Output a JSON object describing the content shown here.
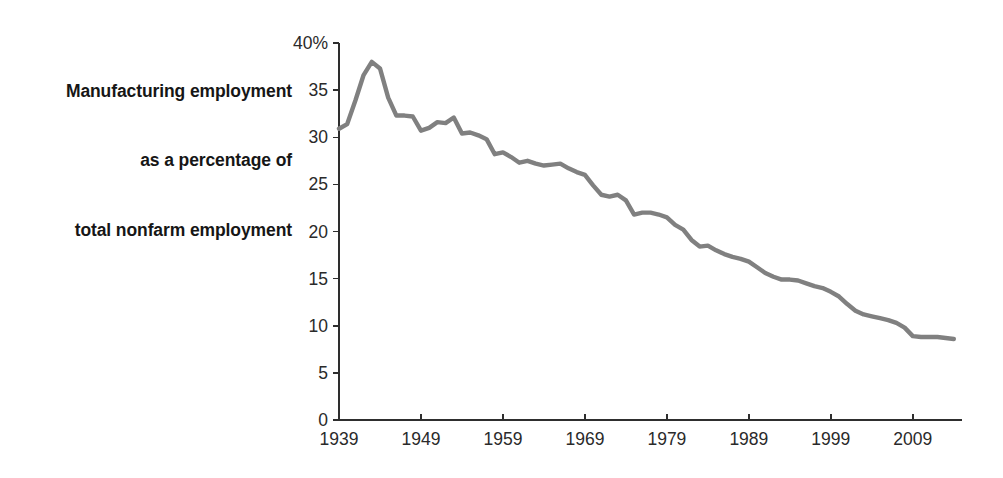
{
  "figure": {
    "background_color": "#ffffff",
    "axis_color": "#2e2e2e",
    "line_color": "#808080",
    "label_lines": [
      "Manufacturing employment",
      "as a percentage of",
      "total nonfarm employment"
    ]
  },
  "chart_data": {
    "type": "line",
    "title": "",
    "subtitle": "",
    "xlabel": "",
    "ylabel": "Manufacturing employment as a percentage of total nonfarm employment",
    "xlim": [
      1939,
      2015
    ],
    "ylim": [
      0,
      40
    ],
    "grid": false,
    "legend": null,
    "y_tick_labels": [
      "40%",
      "35",
      "30",
      "25",
      "20",
      "15",
      "10",
      "5",
      "0"
    ],
    "y_ticks": [
      40,
      35,
      30,
      25,
      20,
      15,
      10,
      5,
      0
    ],
    "x_tick_labels": [
      "1939",
      "1949",
      "1959",
      "1969",
      "1979",
      "1989",
      "1999",
      "2009"
    ],
    "x_ticks": [
      1939,
      1949,
      1959,
      1969,
      1979,
      1989,
      1999,
      2009
    ],
    "series": [
      {
        "name": "Manufacturing share of total nonfarm employment",
        "color": "#808080",
        "x": [
          1939,
          1940,
          1941,
          1942,
          1943,
          1944,
          1945,
          1946,
          1947,
          1948,
          1949,
          1950,
          1951,
          1952,
          1953,
          1954,
          1955,
          1956,
          1957,
          1958,
          1959,
          1960,
          1961,
          1962,
          1963,
          1964,
          1965,
          1966,
          1967,
          1968,
          1969,
          1970,
          1971,
          1972,
          1973,
          1974,
          1975,
          1976,
          1977,
          1978,
          1979,
          1980,
          1981,
          1982,
          1983,
          1984,
          1985,
          1986,
          1987,
          1988,
          1989,
          1990,
          1991,
          1992,
          1993,
          1994,
          1995,
          1996,
          1997,
          1998,
          1999,
          2000,
          2001,
          2002,
          2003,
          2004,
          2005,
          2006,
          2007,
          2008,
          2009,
          2010,
          2011,
          2012,
          2013,
          2014
        ],
        "values": [
          30.9,
          31.4,
          33.9,
          36.6,
          38.0,
          37.3,
          34.2,
          32.3,
          32.3,
          32.2,
          30.7,
          31.0,
          31.6,
          31.5,
          32.1,
          30.4,
          30.5,
          30.2,
          29.8,
          28.2,
          28.4,
          27.9,
          27.3,
          27.5,
          27.2,
          27.0,
          27.1,
          27.2,
          26.7,
          26.3,
          26.0,
          24.9,
          23.9,
          23.7,
          23.9,
          23.3,
          21.8,
          22.0,
          22.0,
          21.8,
          21.5,
          20.7,
          20.2,
          19.1,
          18.4,
          18.5,
          18.0,
          17.6,
          17.3,
          17.1,
          16.8,
          16.2,
          15.6,
          15.2,
          14.9,
          14.9,
          14.8,
          14.5,
          14.2,
          14.0,
          13.6,
          13.1,
          12.3,
          11.6,
          11.2,
          11.0,
          10.8,
          10.6,
          10.3,
          9.8,
          8.9,
          8.8,
          8.8,
          8.8,
          8.7,
          8.6
        ]
      }
    ],
    "annotations": [
      {
        "text": "Peak near 38% during World War II (1943–1944)",
        "x": 1943,
        "y": 38.0
      },
      {
        "text": "Start value about 31% in 1939",
        "x": 1939,
        "y": 30.9
      },
      {
        "text": "Flattens near 9% after 2009",
        "x": 2010,
        "y": 8.8
      }
    ]
  }
}
